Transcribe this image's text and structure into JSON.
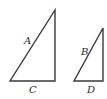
{
  "diagram": {
    "stroke_color": "#3a3a3a",
    "triangles": [
      {
        "id": "large",
        "points": [
          [
            55,
            10
          ],
          [
            10,
            81
          ],
          [
            55,
            81
          ]
        ],
        "labels": {
          "hypotenuse": {
            "text": "A",
            "x": 24,
            "y": 44
          },
          "base": {
            "text": "C",
            "x": 29,
            "y": 93
          }
        }
      },
      {
        "id": "small",
        "points": [
          [
            103,
            28
          ],
          [
            74,
            81
          ],
          [
            103,
            81
          ]
        ],
        "labels": {
          "hypotenuse": {
            "text": "B",
            "x": 81,
            "y": 55
          },
          "base": {
            "text": "D",
            "x": 87,
            "y": 93
          }
        }
      }
    ]
  }
}
